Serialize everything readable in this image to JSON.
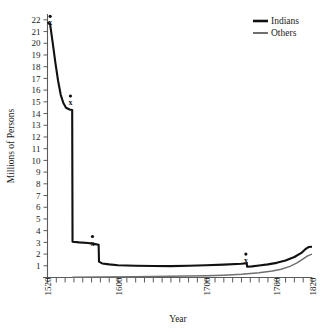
{
  "chart_data": {
    "type": "line",
    "title": "",
    "xlabel": "Year",
    "ylabel": "Millions of Persons",
    "xlim": [
      1520,
      1820
    ],
    "ylim": [
      0,
      22.5
    ],
    "grid": false,
    "legend_position": "top-right",
    "y_ticks": [
      1,
      2,
      3,
      4,
      5,
      6,
      7,
      8,
      9,
      10,
      11,
      12,
      13,
      14,
      15,
      16,
      17,
      18,
      19,
      20,
      21,
      22
    ],
    "x_ticks": [
      1520,
      1530,
      1540,
      1550,
      1560,
      1570,
      1580,
      1590,
      1600,
      1610,
      1620,
      1630,
      1640,
      1650,
      1660,
      1670,
      1680,
      1690,
      1700,
      1710,
      1720,
      1730,
      1740,
      1750,
      1760,
      1770,
      1780,
      1790,
      1800,
      1810,
      1820
    ],
    "x_tick_labels": [
      {
        "value": 1520,
        "label": "1520"
      },
      {
        "value": 1600,
        "label": "1600"
      },
      {
        "value": 1700,
        "label": "1700"
      },
      {
        "value": 1780,
        "label": "1780"
      },
      {
        "value": 1820,
        "label": "1820"
      }
    ],
    "series": [
      {
        "name": "Indians",
        "color": "#111111",
        "points": [
          [
            1520,
            21.8
          ],
          [
            1523,
            21.6
          ],
          [
            1526,
            20.0
          ],
          [
            1529,
            18.3
          ],
          [
            1532,
            16.8
          ],
          [
            1535,
            15.6
          ],
          [
            1538,
            14.9
          ],
          [
            1541,
            14.5
          ],
          [
            1545,
            14.35
          ],
          [
            1548,
            14.3
          ],
          [
            1548.4,
            3.05
          ],
          [
            1556,
            3.0
          ],
          [
            1566,
            2.95
          ],
          [
            1574,
            2.85
          ],
          [
            1578,
            2.8
          ],
          [
            1578.4,
            1.35
          ],
          [
            1582,
            1.2
          ],
          [
            1590,
            1.12
          ],
          [
            1600,
            1.05
          ],
          [
            1620,
            1.0
          ],
          [
            1640,
            0.98
          ],
          [
            1660,
            0.97
          ],
          [
            1680,
            1.0
          ],
          [
            1700,
            1.04
          ],
          [
            1720,
            1.1
          ],
          [
            1740,
            1.18
          ],
          [
            1746,
            1.22
          ],
          [
            1746.4,
            0.92
          ],
          [
            1752,
            0.95
          ],
          [
            1760,
            1.02
          ],
          [
            1770,
            1.12
          ],
          [
            1780,
            1.25
          ],
          [
            1790,
            1.45
          ],
          [
            1800,
            1.75
          ],
          [
            1808,
            2.1
          ],
          [
            1813,
            2.45
          ],
          [
            1816,
            2.6
          ],
          [
            1820,
            2.62
          ]
        ]
      },
      {
        "name": "Others",
        "color": "#6f6f6f",
        "points": [
          [
            1548,
            0.03
          ],
          [
            1580,
            0.05
          ],
          [
            1620,
            0.07
          ],
          [
            1660,
            0.1
          ],
          [
            1700,
            0.15
          ],
          [
            1720,
            0.2
          ],
          [
            1740,
            0.28
          ],
          [
            1760,
            0.4
          ],
          [
            1775,
            0.55
          ],
          [
            1785,
            0.7
          ],
          [
            1795,
            0.95
          ],
          [
            1803,
            1.25
          ],
          [
            1810,
            1.6
          ],
          [
            1815,
            1.85
          ],
          [
            1820,
            2.0
          ]
        ]
      }
    ],
    "annotations": [
      {
        "marker": "dot-with-x",
        "label": "x",
        "x": 1523,
        "y": 22.3
      },
      {
        "marker": "dot-with-x",
        "label": "x",
        "x": 1546,
        "y": 15.5
      },
      {
        "marker": "dot-with-x",
        "label": "x",
        "x": 1571,
        "y": 3.5
      },
      {
        "marker": "dot-with-x",
        "label": "x",
        "x": 1745,
        "y": 2.0
      }
    ],
    "legend": [
      {
        "label": "Indians",
        "color": "#111111",
        "width": 2.6
      },
      {
        "label": "Others",
        "color": "#6f6f6f",
        "width": 2.0
      }
    ]
  }
}
